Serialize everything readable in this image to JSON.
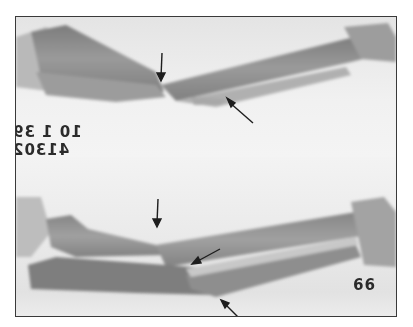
{
  "image": {
    "description": "Radiograph of forearm showing fractures of radius and ulna, two views",
    "views": [
      {
        "name": "top-view",
        "arrows": 2
      },
      {
        "name": "bottom-view",
        "arrows": 3
      }
    ]
  },
  "labels": {
    "date_mirrored": "10 1 39",
    "id_mirrored": "41302",
    "corner_number": "99"
  },
  "colors": {
    "background": "#ffffff",
    "film": "#efefef",
    "bone": "#8a8a8a",
    "frame": "#3a3a3a",
    "arrow": "#1e1e1e"
  }
}
